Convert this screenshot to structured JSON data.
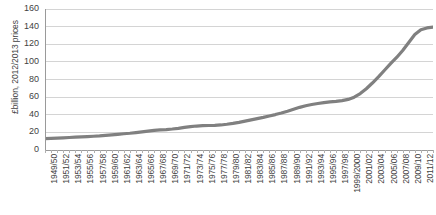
{
  "chart_data": {
    "type": "line",
    "title": "",
    "xlabel": "",
    "ylabel": "£billion, 2012/2013 prices",
    "ylim": [
      0,
      160
    ],
    "yticks": [
      0,
      20,
      40,
      60,
      80,
      100,
      120,
      140,
      160
    ],
    "grid": true,
    "legend": "none",
    "line_color": "#808080",
    "gridline_color": "#d4d4d4",
    "axis_color": "#9a9a9a",
    "x": [
      "1949/50",
      "1950/51",
      "1951/52",
      "1952/53",
      "1953/54",
      "1954/55",
      "1955/56",
      "1956/57",
      "1957/58",
      "1958/59",
      "1959/60",
      "1960/61",
      "1961/62",
      "1962/63",
      "1963/64",
      "1964/65",
      "1965/66",
      "1966/67",
      "1967/68",
      "1968/69",
      "1969/70",
      "1970/71",
      "1971/72",
      "1972/73",
      "1973/74",
      "1974/75",
      "1975/76",
      "1976/77",
      "1977/78",
      "1978/79",
      "1979/80",
      "1980/81",
      "1981/82",
      "1982/83",
      "1983/84",
      "1984/85",
      "1985/86",
      "1986/87",
      "1987/88",
      "1988/89",
      "1989/90",
      "1990/91",
      "1991/92",
      "1992/93",
      "1993/94",
      "1994/95",
      "1995/96",
      "1996/97",
      "1997/98",
      "1998/99",
      "1999/2000",
      "2000/01",
      "2001/02",
      "2002/03",
      "2003/04",
      "2004/05",
      "2005/06",
      "2006/07",
      "2007/08",
      "2008/09",
      "2009/10",
      "2010/11",
      "2011/12",
      "2012/13",
      "2013/14"
    ],
    "xtick_labels": [
      "1949/50",
      "1951/52",
      "1953/54",
      "1955/56",
      "1957/58",
      "1959/60",
      "1961/62",
      "1963/64",
      "1965/66",
      "1967/68",
      "1969/70",
      "1971/72",
      "1973/74",
      "1975/76",
      "1977/78",
      "1979/80",
      "1981/82",
      "1983/84",
      "1985/86",
      "1987/88",
      "1989/90",
      "1991/92",
      "1993/94",
      "1995/96",
      "1997/98",
      "1999/2000",
      "2001/02",
      "2003/04",
      "2005/06",
      "2007/08",
      "2009/10",
      "2011/12",
      "2013/14"
    ],
    "values": [
      13.0,
      13.2,
      13.5,
      13.8,
      14.2,
      14.5,
      14.8,
      15.2,
      15.6,
      16.0,
      16.6,
      17.2,
      17.8,
      18.4,
      19.0,
      19.8,
      20.6,
      21.4,
      22.2,
      22.8,
      23.2,
      23.8,
      24.6,
      25.6,
      26.6,
      27.2,
      27.6,
      27.8,
      28.0,
      28.4,
      29.2,
      30.2,
      31.4,
      32.8,
      34.2,
      35.6,
      37.0,
      38.6,
      40.2,
      42.0,
      44.0,
      46.2,
      48.4,
      50.2,
      51.6,
      52.8,
      53.8,
      54.6,
      55.2,
      56.0,
      57.4,
      60.0,
      64.0,
      69.5,
      76.0,
      83.0,
      90.5,
      98.0,
      105.0,
      113.0,
      122.0,
      131.0,
      136.5,
      138.5,
      139.5
    ]
  }
}
